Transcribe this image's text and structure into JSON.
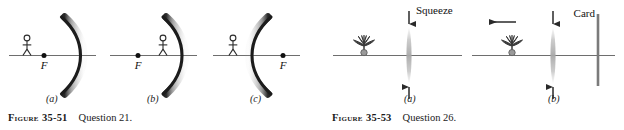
{
  "page": {
    "background_color": "#ffffff",
    "width": 624,
    "height": 130
  },
  "figures": [
    {
      "id": "figure-35-51",
      "figure_word": "Figure",
      "figure_number": "35-51",
      "caption_text": "Question 21.",
      "caption_full": "FIGURE 35-51    Question 21.",
      "panels": [
        {
          "key": "a",
          "label": "(a)",
          "mirror_orientation": "concave-left",
          "mirror_description": "curved mirror bulging right, reflecting surface facing left",
          "focal_point_label": "F",
          "observer": "stick-figure",
          "observer_side": "left-of-focal-point"
        },
        {
          "key": "b",
          "label": "(b)",
          "mirror_orientation": "concave-left",
          "mirror_description": "curved mirror bulging right, reflecting surface facing left",
          "focal_point_label": "F",
          "observer": "stick-figure",
          "observer_side": "right-of-focal-point"
        },
        {
          "key": "c",
          "label": "(c)",
          "mirror_orientation": "concave-right",
          "mirror_description": "curved mirror bulging left, reflecting surface facing right",
          "focal_point_label": "F",
          "observer": "stick-figure",
          "observer_side": "left-of-mirror"
        }
      ]
    },
    {
      "id": "figure-35-53",
      "figure_word": "Figure",
      "figure_number": "35-53",
      "caption_text": "Question 26.",
      "caption_full": "FIGURE 35-53    Question 26.",
      "panels": [
        {
          "key": "a",
          "label": "(a)",
          "object": "potted-flower",
          "lens": "thin-converging-lens",
          "squeeze_label": "Squeeze",
          "arrows": [
            "down-arrow-above-lens",
            "up-arrow-below-lens"
          ],
          "card_label": null
        },
        {
          "key": "b",
          "label": "(b)",
          "object": "potted-flower",
          "lens": "thin-converging-lens",
          "squeeze_label": null,
          "motion_arrow": "left-arrow-above-flower",
          "arrows": [
            "down-arrow-above-lens",
            "up-arrow-below-lens"
          ],
          "card_label": "Card"
        }
      ]
    }
  ],
  "colors": {
    "axis": "#6e6e6e",
    "mirror_core": "#1c1c1c",
    "mirror_shadow": "#9a9a9a",
    "lens": "#b9b9b9",
    "arrow": "#2a2a2a",
    "flower": "#3a3a3a",
    "pot": "#8e8e8e",
    "card": "#7b7b7b",
    "text": "#111111"
  }
}
